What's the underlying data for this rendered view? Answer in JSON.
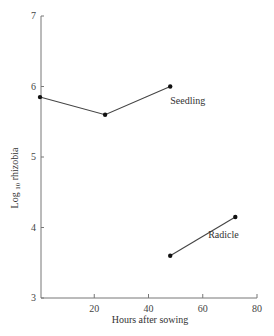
{
  "chart_data": {
    "type": "line",
    "title": "",
    "xlabel": "Hours after sowing",
    "ylabel": "Log 10 rhizobia",
    "ylabel_parts": {
      "pre": "Log",
      "sub": "10",
      "post": " rhizobia"
    },
    "xlim": [
      0,
      80
    ],
    "ylim": [
      3,
      7
    ],
    "xticks": [
      20,
      40,
      60,
      80
    ],
    "yticks": [
      3,
      4,
      5,
      6,
      7
    ],
    "grid": false,
    "legend": "none (inline labels)",
    "series": [
      {
        "name": "Seedling",
        "x": [
          0,
          24,
          48
        ],
        "y": [
          5.85,
          5.6,
          6.0
        ],
        "label_pos": {
          "x": 48,
          "y": 5.75
        }
      },
      {
        "name": "Radicle",
        "x": [
          48,
          72
        ],
        "y": [
          3.6,
          4.15
        ],
        "label_pos": {
          "x": 62,
          "y": 3.85
        }
      }
    ],
    "colors": {
      "line": "#444444",
      "axis": "#777777",
      "marker": "#111111"
    }
  }
}
